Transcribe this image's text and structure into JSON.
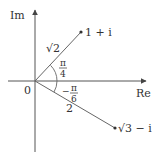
{
  "diagram": {
    "type": "complex-plane",
    "axes": {
      "x_label": "Re",
      "y_label": "Im",
      "origin_label": "0"
    },
    "points": [
      {
        "label": "1 + i",
        "modulus_label": "√2",
        "angle_label_num": "π",
        "angle_label_den": "4",
        "angle_sign": ""
      },
      {
        "label": "√3 − i",
        "modulus_label": "2",
        "angle_label_num": "π",
        "angle_label_den": "6",
        "angle_sign": "−"
      }
    ],
    "colors": {
      "line": "#555555",
      "text": "#333333",
      "background": "#ffffff"
    }
  }
}
